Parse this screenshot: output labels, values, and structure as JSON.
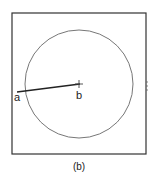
{
  "figure": {
    "caption": "(b)",
    "frame": {
      "x": 12,
      "y": 13,
      "width": 134,
      "height": 141,
      "stroke": "#333333"
    },
    "circle": {
      "cx": 79,
      "cy": 84,
      "r": 54,
      "stroke": "#777777"
    },
    "segment": {
      "from": {
        "label": "a",
        "x": 17,
        "y": 92
      },
      "to": {
        "label": "b",
        "x": 79,
        "y": 84
      }
    },
    "center_marker": "cross"
  }
}
